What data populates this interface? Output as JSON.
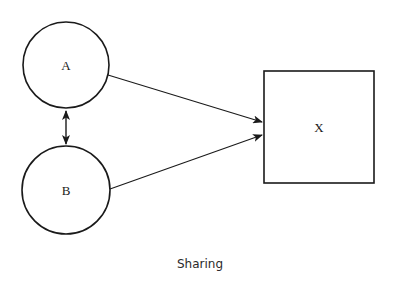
{
  "diagram": {
    "caption": "Sharing",
    "nodes": [
      {
        "id": "A",
        "label": "A",
        "shape": "circle"
      },
      {
        "id": "B",
        "label": "B",
        "shape": "circle"
      },
      {
        "id": "X",
        "label": "X",
        "shape": "square"
      }
    ],
    "edges": [
      {
        "from": "A",
        "to": "B",
        "type": "bidirectional"
      },
      {
        "from": "A",
        "to": "X",
        "type": "directed"
      },
      {
        "from": "B",
        "to": "X",
        "type": "directed"
      }
    ],
    "colors": {
      "stroke": "#1a1a1a",
      "background": "#ffffff"
    }
  }
}
